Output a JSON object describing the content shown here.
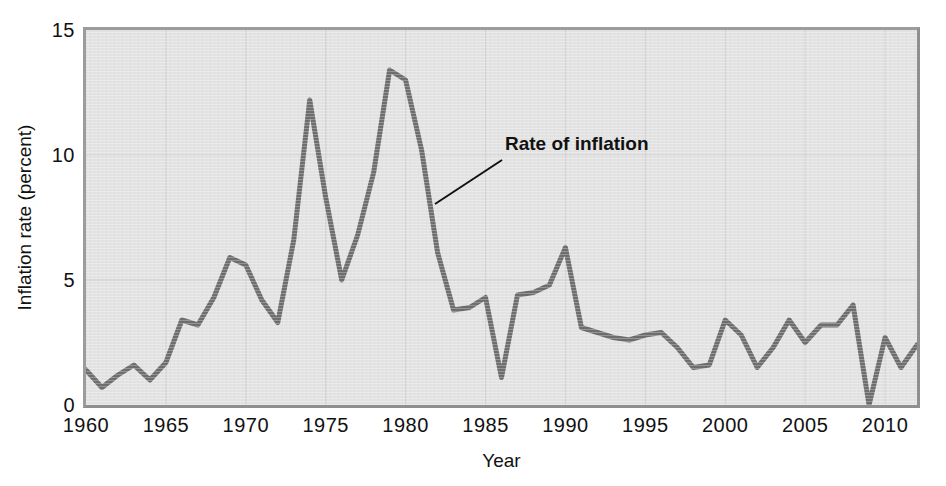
{
  "chart_data": {
    "type": "line",
    "title": "",
    "xlabel": "Year",
    "ylabel": "Inflation rate (percent)",
    "xlim": [
      1960,
      2012
    ],
    "ylim": [
      0,
      15
    ],
    "ytick_labels": [
      "15",
      "10",
      "5",
      "0"
    ],
    "ytick_values": [
      15,
      10,
      5,
      0
    ],
    "xtick_labels": [
      "1960",
      "1965",
      "1970",
      "1975",
      "1980",
      "1985",
      "1990",
      "1995",
      "2000",
      "2005",
      "2010"
    ],
    "xtick_values": [
      1960,
      1965,
      1970,
      1975,
      1980,
      1985,
      1990,
      1995,
      2000,
      2005,
      2010
    ],
    "grid": true,
    "legend": "none",
    "series": [
      {
        "name": "Rate of inflation",
        "color": "#6e6e6e",
        "x": [
          1960,
          1961,
          1962,
          1963,
          1964,
          1965,
          1966,
          1967,
          1968,
          1969,
          1970,
          1971,
          1972,
          1973,
          1974,
          1975,
          1976,
          1977,
          1978,
          1979,
          1980,
          1981,
          1982,
          1983,
          1984,
          1985,
          1986,
          1987,
          1988,
          1989,
          1990,
          1991,
          1992,
          1993,
          1994,
          1995,
          1996,
          1997,
          1998,
          1999,
          2000,
          2001,
          2002,
          2003,
          2004,
          2005,
          2006,
          2007,
          2008,
          2009,
          2010,
          2011,
          2012
        ],
        "values": [
          1.4,
          0.7,
          1.2,
          1.6,
          1.0,
          1.7,
          3.4,
          3.2,
          4.3,
          5.9,
          5.6,
          4.2,
          3.3,
          6.6,
          12.2,
          8.3,
          5.0,
          6.8,
          9.3,
          13.4,
          13.0,
          10.2,
          6.1,
          3.8,
          3.9,
          4.3,
          1.1,
          4.4,
          4.5,
          4.8,
          6.3,
          3.1,
          2.9,
          2.7,
          2.6,
          2.8,
          2.9,
          2.3,
          1.5,
          1.6,
          3.4,
          2.8,
          1.5,
          2.3,
          3.4,
          2.5,
          3.2,
          3.2,
          4.0,
          0.0,
          2.7,
          1.5,
          2.4
        ]
      }
    ],
    "annotations": [
      {
        "text": "Rate of inflation",
        "label_x": 505,
        "label_y": 133,
        "leader_from": [
          502,
          160
        ],
        "leader_to": [
          435,
          204
        ]
      }
    ],
    "colors": {
      "plot_background": "#e3e3e3",
      "frame": "#9c9c9c",
      "line": "#6e6e6e",
      "gridline": "#cfcfcf",
      "text": "#111111",
      "page_background": "#ffffff"
    }
  }
}
